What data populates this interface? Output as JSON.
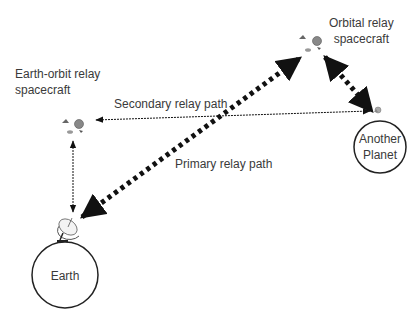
{
  "diagram": {
    "labels": {
      "earth_orbit_relay": [
        "Earth-orbit relay",
        "spacecraft"
      ],
      "orbital_relay": [
        "Orbital relay",
        "spacecraft"
      ],
      "secondary_path": "Secondary relay path",
      "primary_path": "Primary relay path",
      "earth": "Earth",
      "another_planet": [
        "Another",
        "Planet"
      ]
    },
    "nodes": [
      {
        "id": "earth",
        "label": "Earth",
        "shape": "circle"
      },
      {
        "id": "ground-antenna",
        "label": "",
        "shape": "dish-antenna-icon"
      },
      {
        "id": "earth-orbit-relay",
        "label": "Earth-orbit relay spacecraft",
        "shape": "spacecraft-icon"
      },
      {
        "id": "orbital-relay",
        "label": "Orbital relay spacecraft",
        "shape": "spacecraft-icon"
      },
      {
        "id": "another-planet",
        "label": "Another Planet",
        "shape": "circle"
      }
    ],
    "edges": [
      {
        "from": "ground-antenna",
        "to": "orbital-relay",
        "label": "Primary relay path",
        "style": "thick-dotted",
        "arrows": "both"
      },
      {
        "from": "orbital-relay",
        "to": "another-planet",
        "label": "",
        "style": "thick-dotted",
        "arrows": "both"
      },
      {
        "from": "earth-orbit-relay",
        "to": "another-planet",
        "label": "Secondary relay path",
        "style": "thin-dotted",
        "arrows": "both"
      },
      {
        "from": "earth-orbit-relay",
        "to": "ground-antenna",
        "label": "",
        "style": "thin-dotted",
        "arrows": "both"
      }
    ]
  }
}
